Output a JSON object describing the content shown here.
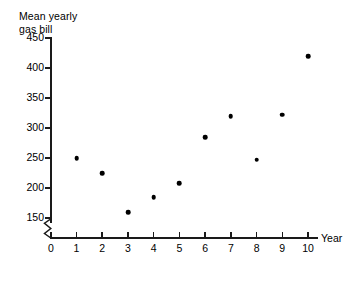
{
  "chart_data": {
    "type": "scatter",
    "title": "",
    "ylabel": "Mean yearly\ngas bill",
    "xlabel": "Year",
    "x": [
      1,
      2,
      3,
      4,
      5,
      6,
      7,
      8,
      9,
      10
    ],
    "values": [
      250,
      225,
      160,
      185,
      208,
      285,
      320,
      247,
      322,
      420
    ],
    "points": [
      {
        "x": 1,
        "y": 250
      },
      {
        "x": 2,
        "y": 225
      },
      {
        "x": 3,
        "y": 160
      },
      {
        "x": 4,
        "y": 185
      },
      {
        "x": 5,
        "y": 208
      },
      {
        "x": 6,
        "y": 285
      },
      {
        "x": 7,
        "y": 320
      },
      {
        "x": 8,
        "y": 247
      },
      {
        "x": 9,
        "y": 322
      },
      {
        "x": 10,
        "y": 420
      }
    ],
    "xlim": [
      0,
      10
    ],
    "ylim": [
      150,
      450
    ],
    "xticks": [
      "0",
      "1",
      "2",
      "3",
      "4",
      "5",
      "6",
      "7",
      "8",
      "9",
      "10"
    ],
    "yticks": [
      "150",
      "200",
      "250",
      "300",
      "350",
      "400",
      "450"
    ],
    "grid": false,
    "legend": null,
    "y_axis_break": true,
    "marker_color": "#000000",
    "axis_color": "#1a1a1a"
  },
  "axes": {
    "y_title": "Mean yearly\ngas bill",
    "x_title": "Year",
    "y_tick_labels": [
      "450",
      "400",
      "350",
      "300",
      "250",
      "200",
      "150"
    ],
    "x_tick_labels": [
      "0",
      "1",
      "2",
      "3",
      "4",
      "5",
      "6",
      "7",
      "8",
      "9",
      "10"
    ]
  }
}
